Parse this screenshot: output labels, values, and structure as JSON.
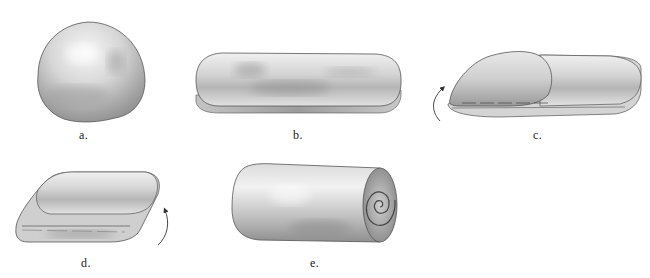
{
  "figure": {
    "panels": [
      {
        "id": "a",
        "label": "a.",
        "description": "round ball of dough"
      },
      {
        "id": "b",
        "label": "b.",
        "description": "dough flattened into an oblong slab"
      },
      {
        "id": "c",
        "label": "c.",
        "description": "one end folded over toward center"
      },
      {
        "id": "d",
        "label": "d.",
        "description": "other end folded over, layered"
      },
      {
        "id": "e",
        "label": "e.",
        "description": "dough rolled into a log with spiral end"
      }
    ],
    "arrows": [
      {
        "panel": "c",
        "direction": "counterclockwise-up",
        "icon": "curved-arrow-icon"
      },
      {
        "panel": "d",
        "direction": "clockwise-up",
        "icon": "curved-arrow-icon"
      }
    ],
    "colors": {
      "outline": "#555555",
      "shade_dark": "#8a8a8a",
      "shade_light": "#f2f2f2"
    }
  }
}
